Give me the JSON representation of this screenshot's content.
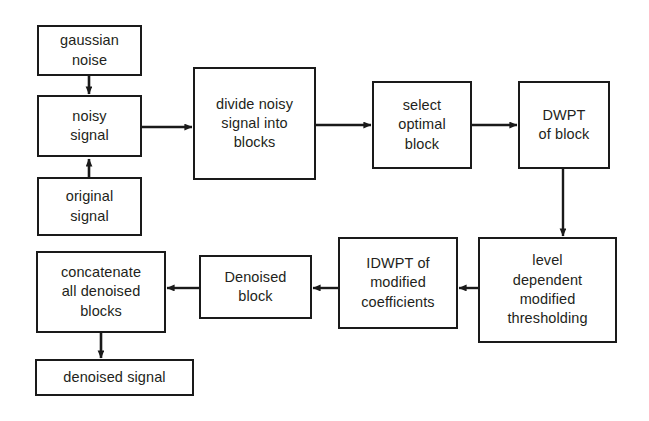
{
  "diagram": {
    "type": "flowchart",
    "canvas": {
      "width": 649,
      "height": 421
    },
    "style": {
      "background": "#ffffff",
      "box_border_color": "#1a1a1a",
      "box_fill": "#ffffff",
      "text_color": "#231f20",
      "arrow_color": "#1a1a1a"
    },
    "nodes": [
      {
        "id": "gaussian-noise",
        "label": "gaussian\nnoise",
        "x": 37,
        "y": 25,
        "w": 105,
        "h": 51
      },
      {
        "id": "noisy-signal",
        "label": "noisy\nsignal",
        "x": 37,
        "y": 95,
        "w": 105,
        "h": 62
      },
      {
        "id": "original-signal",
        "label": "original\nsignal",
        "x": 37,
        "y": 177,
        "w": 105,
        "h": 59
      },
      {
        "id": "divide-noisy-signal",
        "label": "divide noisy\nsignal into\nblocks",
        "x": 193,
        "y": 67,
        "w": 123,
        "h": 113
      },
      {
        "id": "select-optimal",
        "label": "select\noptimal\nblock",
        "x": 372,
        "y": 81,
        "w": 100,
        "h": 88
      },
      {
        "id": "dwpt-of-block",
        "label": "DWPT\nof block",
        "x": 518,
        "y": 81,
        "w": 92,
        "h": 88
      },
      {
        "id": "level-thresholding",
        "label": "level\ndependent\nmodified\nthresholding",
        "x": 478,
        "y": 237,
        "w": 139,
        "h": 106
      },
      {
        "id": "idwpt-modified",
        "label": "IDWPT of\nmodified\ncoefficients",
        "x": 338,
        "y": 237,
        "w": 120,
        "h": 92
      },
      {
        "id": "denoised-block",
        "label": "Denoised\nblock",
        "x": 199,
        "y": 255,
        "w": 113,
        "h": 64
      },
      {
        "id": "concatenate-blocks",
        "label": "concatenate\nall denoised\nblocks",
        "x": 36,
        "y": 251,
        "w": 130,
        "h": 82
      },
      {
        "id": "denoised-signal",
        "label": "denoised signal",
        "x": 35,
        "y": 359,
        "w": 159,
        "h": 37
      }
    ],
    "edges": [
      {
        "id": "edge-gaussian-to-noisy",
        "from": "gaussian-noise",
        "to": "noisy-signal",
        "direction": "down"
      },
      {
        "id": "edge-original-to-noisy",
        "from": "original-signal",
        "to": "noisy-signal",
        "direction": "up"
      },
      {
        "id": "edge-noisy-to-divide",
        "from": "noisy-signal",
        "to": "divide-noisy-signal",
        "direction": "right"
      },
      {
        "id": "edge-divide-to-select",
        "from": "divide-noisy-signal",
        "to": "select-optimal",
        "direction": "right"
      },
      {
        "id": "edge-select-to-dwpt",
        "from": "select-optimal",
        "to": "dwpt-of-block",
        "direction": "right"
      },
      {
        "id": "edge-dwpt-to-threshold",
        "from": "dwpt-of-block",
        "to": "level-thresholding",
        "direction": "down"
      },
      {
        "id": "edge-threshold-to-idwpt",
        "from": "level-thresholding",
        "to": "idwpt-modified",
        "direction": "left"
      },
      {
        "id": "edge-idwpt-to-denoised-block",
        "from": "idwpt-modified",
        "to": "denoised-block",
        "direction": "left"
      },
      {
        "id": "edge-denoised-block-to-concat",
        "from": "denoised-block",
        "to": "concatenate-blocks",
        "direction": "left"
      },
      {
        "id": "edge-concat-to-denoised-signal",
        "from": "concatenate-blocks",
        "to": "denoised-signal",
        "direction": "down"
      }
    ]
  }
}
